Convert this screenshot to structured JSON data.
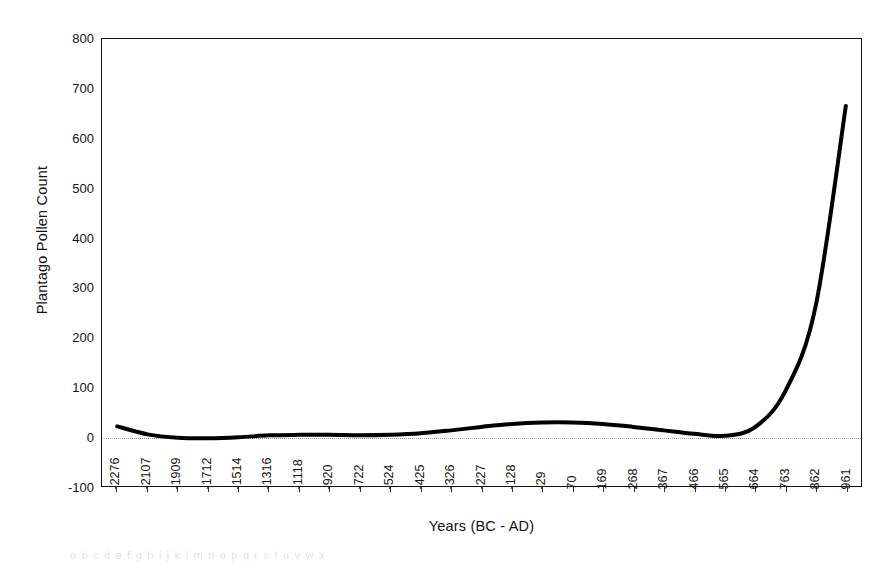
{
  "chart_data": {
    "type": "line",
    "title": "",
    "xlabel": "Years (BC - AD)",
    "ylabel": "Plantago Pollen Count",
    "grid": false,
    "zero_gridline": true,
    "legend": "none",
    "ylim": [
      -100,
      800
    ],
    "yticks": [
      800,
      700,
      600,
      500,
      400,
      300,
      200,
      100,
      0,
      -100
    ],
    "ytick_labels": [
      "800",
      "700",
      "600",
      "500",
      "400",
      "300",
      "200",
      "100",
      "0",
      "-100"
    ],
    "categories": [
      "-2276",
      "-2107",
      "-1909",
      "-1712",
      "-1514",
      "-1316",
      "-1118",
      "-920",
      "-722",
      "-524",
      "-425",
      "-326",
      "-227",
      "-128",
      "-29",
      "70",
      "169",
      "268",
      "367",
      "466",
      "565",
      "664",
      "763",
      "862",
      "961"
    ],
    "series": [
      {
        "name": "Plantago Pollen Count",
        "color": "#000000",
        "values": [
          20,
          4,
          -3,
          -4,
          -2,
          2,
          3,
          3,
          2,
          3,
          6,
          12,
          19,
          25,
          28,
          28,
          25,
          19,
          12,
          5,
          1,
          18,
          90,
          260,
          665
        ]
      }
    ],
    "annotations": []
  },
  "axes": {
    "y_title": "Plantago Pollen Count",
    "x_title": "Years (BC - AD)"
  },
  "scan": {
    "artifact_text": "a b c d   e f g h   i j k l   m n o p   q r s t   u v w x"
  }
}
